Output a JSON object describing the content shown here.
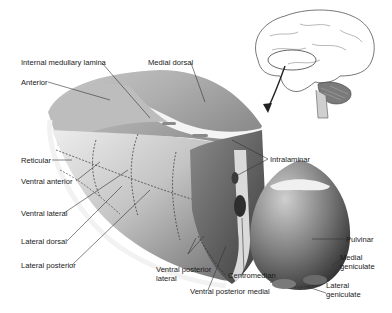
{
  "diagram": {
    "inset": "brain-lateral-view-with-thalamus-highlight",
    "labels": {
      "internal_medullary_lamina": "Internal medullary lamina",
      "medial_dorsal": "Medial dorsal",
      "anterior": "Anterior",
      "intralaminar": "Intralaminar",
      "reticular": "Reticular",
      "ventral_anterior": "Ventral anterior",
      "ventral_lateral": "Ventral lateral",
      "lateral_dorsal": "Lateral dorsal",
      "lateral_posterior": "Lateral posterior",
      "ventral_posterior_lateral_1": "Ventral posterior",
      "ventral_posterior_lateral_2": "lateral",
      "centromedian": "Centromedian",
      "ventral_posterior_medial": "Ventral posterior medial",
      "pulvinar": "Pulvinar",
      "medial_geniculate_1": "Medial",
      "medial_geniculate_2": "geniculate",
      "lateral_geniculate_1": "Lateral",
      "lateral_geniculate_2": "geniculate"
    },
    "colors": {
      "background": "#ffffff",
      "shape_light": "#e6e6e6",
      "shape_mid": "#a8a8a8",
      "shape_dark": "#4a4a4a",
      "leader_line": "#333333"
    }
  }
}
